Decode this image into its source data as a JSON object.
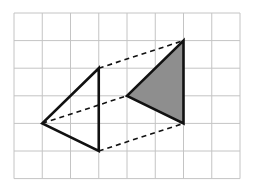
{
  "diagram": {
    "type": "grid-translation",
    "grid": {
      "cols": 8,
      "rows": 6,
      "origin_px": [
        14,
        13
      ],
      "cell_px": [
        28.25,
        27.6
      ],
      "line_color": "#c4c4c4"
    },
    "shapes": [
      {
        "name": "original-triangle",
        "vertices": [
          [
            3,
            2
          ],
          [
            1,
            4
          ],
          [
            3,
            5
          ]
        ],
        "fill": "none",
        "stroke": "#111111"
      },
      {
        "name": "translated-triangle",
        "vertices": [
          [
            6,
            1
          ],
          [
            4,
            3
          ],
          [
            6,
            4
          ]
        ],
        "fill": "#8e8e8e",
        "stroke": "#111111"
      }
    ],
    "connectors": [
      {
        "from": [
          3,
          2
        ],
        "to": [
          6,
          1
        ]
      },
      {
        "from": [
          1,
          4
        ],
        "to": [
          4,
          3
        ]
      },
      {
        "from": [
          3,
          5
        ],
        "to": [
          6,
          4
        ]
      }
    ],
    "translation_vector": [
      3,
      -1
    ]
  }
}
